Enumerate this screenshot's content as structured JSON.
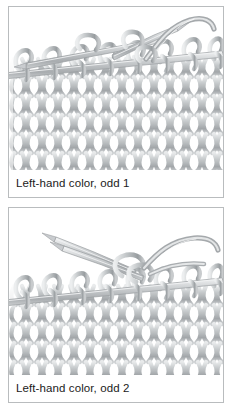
{
  "figure": {
    "style": "grayscale line drawing",
    "background_color": "#ffffff",
    "border_color": "#b9bcbe",
    "yarn_color": "#b4b8ba",
    "yarn_shadow_color": "#8d9194",
    "yarn_highlight_color": "#e6e8e9",
    "needle_color": "#c3c6c8",
    "caption_color": "#1b1b1b"
  },
  "panels": [
    {
      "id": "panel-1",
      "caption": "Left-hand color, odd 1",
      "illustration": {
        "name": "knitting-needles-stitches-step-1",
        "description": "Knitted fabric on a needle with a second needle crossing over and a strand of yarn curving up to the right",
        "needles": 2,
        "yarn_strands": 1
      }
    },
    {
      "id": "panel-2",
      "caption": "Left-hand color, odd 2",
      "illustration": {
        "name": "knitting-needles-stitches-step-2",
        "description": "Knitted fabric on a needle with two needle tips crossing at upper left and a yarn loop being pulled through",
        "needles": 2,
        "yarn_strands": 1
      }
    }
  ]
}
